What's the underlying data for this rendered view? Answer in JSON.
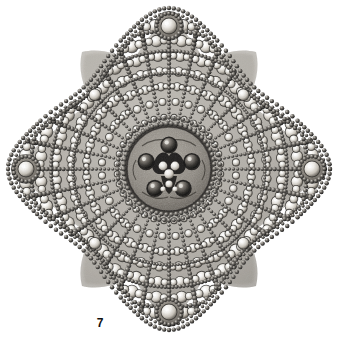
{
  "plate": {
    "kind": "photographic-plate",
    "subject": "Antique jewelled sunburst brooch / pendant",
    "background_color": "#ffffff",
    "caption_number": "7",
    "caption_position": "below-left-of-figure",
    "palette": {
      "background": "#ffffff",
      "metal_dark": "#2b2b2b",
      "metal_mid": "#6b6b6b",
      "stone_light": "#f2f0ec",
      "stone_shadow": "#9a958d",
      "plate_ground": "#8d8880",
      "bead_dark": "#1f1f1f",
      "highlight": "#ffffff"
    }
  },
  "figure": {
    "name": "sunburst-brooch",
    "silhouette": "eight-lobed lozenge with four pointed terminals",
    "center_x": 169,
    "center_y": 169,
    "extent": {
      "left": 13,
      "right": 325,
      "top": 14,
      "bottom": 326
    },
    "terminals": [
      {
        "name": "top-terminal",
        "angle_deg": 270,
        "radius": 152,
        "cap_stone": true
      },
      {
        "name": "right-terminal",
        "angle_deg": 0,
        "radius": 152,
        "cap_stone": true
      },
      {
        "name": "bottom-terminal",
        "angle_deg": 90,
        "radius": 152,
        "cap_stone": true
      },
      {
        "name": "left-terminal",
        "angle_deg": 180,
        "radius": 152,
        "cap_stone": true
      }
    ],
    "diagonal_lobes": [
      {
        "name": "lobe-upper-left",
        "angle_deg": 225,
        "radius": 118,
        "accent_stone": true
      },
      {
        "name": "lobe-upper-right",
        "angle_deg": 315,
        "radius": 118,
        "accent_stone": true
      },
      {
        "name": "lobe-lower-right",
        "angle_deg": 45,
        "radius": 118,
        "accent_stone": true
      },
      {
        "name": "lobe-lower-left",
        "angle_deg": 135,
        "radius": 118,
        "accent_stone": true
      }
    ],
    "ray_count": 32,
    "ray_inner_radius": 46,
    "ray_outer_radius": 145,
    "bead_border_rings": [
      96,
      118,
      138
    ],
    "center_medallion": {
      "name": "center-medallion",
      "radius": 44,
      "ground_color": "#8d8880",
      "cabochon_count": 5,
      "cabochon_radius": 7,
      "cabochon_ring_radius": 24,
      "cluster": "central floral cluster of three stones"
    }
  }
}
